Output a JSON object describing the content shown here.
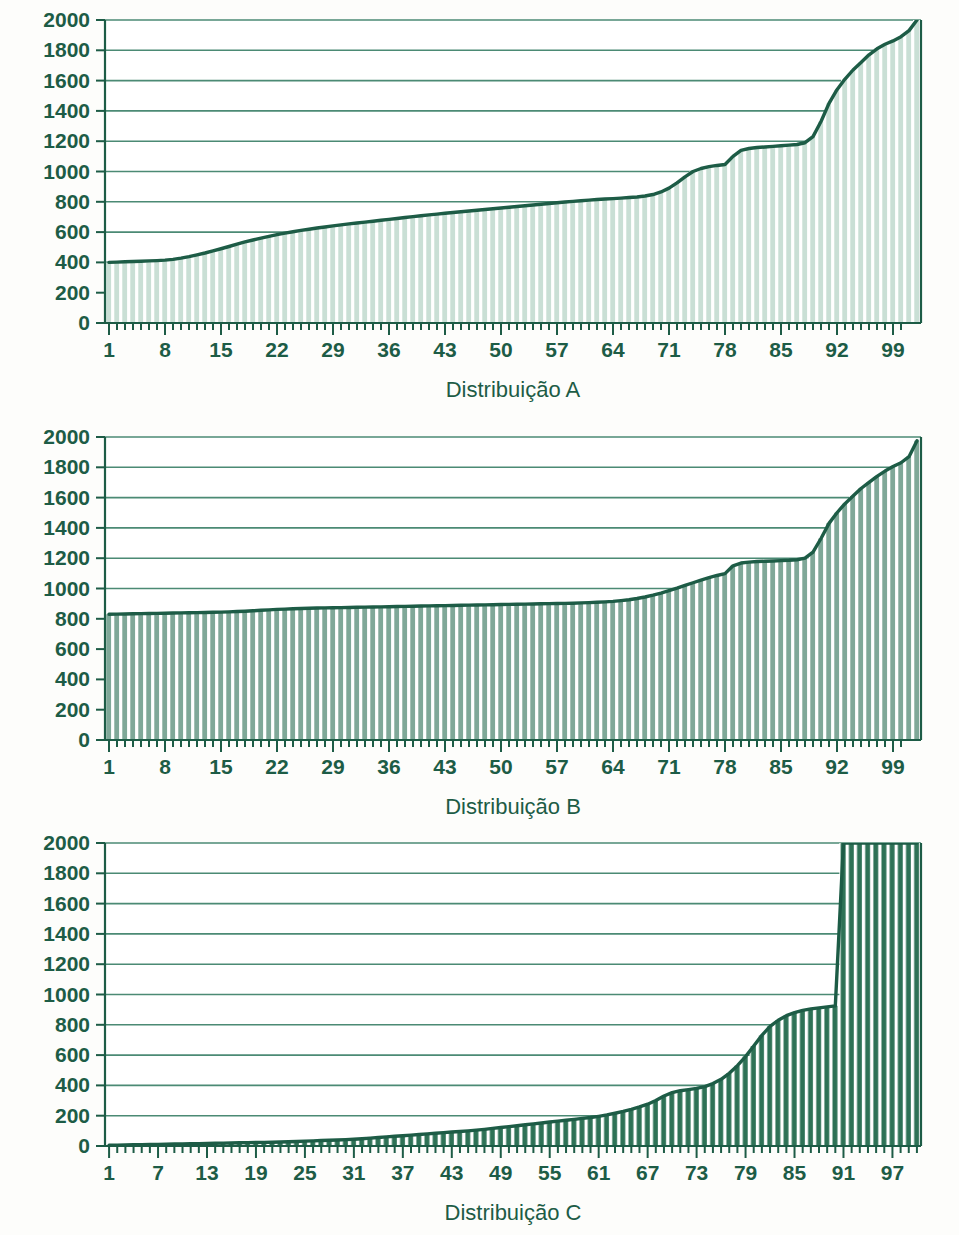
{
  "figure": {
    "background_color": "#fdfdfb",
    "axis_color": "#1d5c46",
    "gridline_color": "#4b8a74"
  },
  "chart_data": [
    {
      "type": "area",
      "id": "distribuicao-a",
      "title": "",
      "xlabel": "Distribuição A",
      "ylabel": "",
      "xlim": [
        1,
        100
      ],
      "ylim": [
        0,
        2000
      ],
      "grid": true,
      "legend": "none",
      "bar_fill_color": "#c9dfd5",
      "bar_gap_color": "#ffffff",
      "line_color": "#1d5c46",
      "ytick_labels": [
        "2000",
        "1800",
        "1600",
        "1400",
        "1200",
        "1000",
        "800",
        "600",
        "400",
        "200",
        "0"
      ],
      "ytick_values": [
        2000,
        1800,
        1600,
        1400,
        1200,
        1000,
        800,
        600,
        400,
        200,
        0
      ],
      "xtick_labels": [
        "1",
        "8",
        "15",
        "22",
        "29",
        "36",
        "43",
        "50",
        "57",
        "64",
        "71",
        "78",
        "85",
        "92",
        "99"
      ],
      "xtick_values": [
        1,
        8,
        15,
        22,
        29,
        36,
        43,
        50,
        57,
        64,
        71,
        78,
        85,
        92,
        99
      ],
      "x": [
        1,
        2,
        3,
        4,
        5,
        6,
        7,
        8,
        9,
        10,
        11,
        12,
        13,
        14,
        15,
        16,
        17,
        18,
        19,
        20,
        21,
        22,
        23,
        24,
        25,
        26,
        27,
        28,
        29,
        30,
        31,
        32,
        33,
        34,
        35,
        36,
        37,
        38,
        39,
        40,
        41,
        42,
        43,
        44,
        45,
        46,
        47,
        48,
        49,
        50,
        51,
        52,
        53,
        54,
        55,
        56,
        57,
        58,
        59,
        60,
        61,
        62,
        63,
        64,
        65,
        66,
        67,
        68,
        69,
        70,
        71,
        72,
        73,
        74,
        75,
        76,
        77,
        78,
        79,
        80,
        81,
        82,
        83,
        84,
        85,
        86,
        87,
        88,
        89,
        90,
        91,
        92,
        93,
        94,
        95,
        96,
        97,
        98,
        99,
        100
      ],
      "values": [
        400,
        402,
        404,
        406,
        408,
        410,
        412,
        415,
        420,
        428,
        438,
        450,
        462,
        476,
        490,
        505,
        520,
        535,
        548,
        560,
        572,
        583,
        593,
        602,
        611,
        619,
        627,
        634,
        641,
        648,
        654,
        660,
        666,
        672,
        678,
        684,
        690,
        696,
        702,
        708,
        714,
        719,
        724,
        729,
        734,
        739,
        744,
        749,
        754,
        759,
        764,
        769,
        774,
        779,
        784,
        789,
        794,
        799,
        803,
        807,
        811,
        815,
        818,
        821,
        824,
        828,
        832,
        838,
        848,
        865,
        890,
        925,
        965,
        1000,
        1020,
        1032,
        1040,
        1046,
        1100,
        1140,
        1152,
        1158,
        1162,
        1166,
        1170,
        1174,
        1178,
        1190,
        1230,
        1330,
        1450,
        1540,
        1610,
        1670,
        1720,
        1770,
        1810,
        1840,
        1862,
        1890,
        1930,
        2000
      ]
    },
    {
      "type": "area",
      "id": "distribuicao-b",
      "title": "",
      "xlabel": "Distribuição B",
      "ylabel": "",
      "xlim": [
        1,
        100
      ],
      "ylim": [
        0,
        2000
      ],
      "grid": true,
      "legend": "none",
      "bar_fill_color": "#7fa898",
      "bar_gap_color": "#ffffff",
      "line_color": "#1d5c46",
      "ytick_labels": [
        "2000",
        "1800",
        "1600",
        "1400",
        "1200",
        "1000",
        "800",
        "600",
        "400",
        "200",
        "0"
      ],
      "ytick_values": [
        2000,
        1800,
        1600,
        1400,
        1200,
        1000,
        800,
        600,
        400,
        200,
        0
      ],
      "xtick_labels": [
        "1",
        "8",
        "15",
        "22",
        "29",
        "36",
        "43",
        "50",
        "57",
        "64",
        "71",
        "78",
        "85",
        "92",
        "99"
      ],
      "xtick_values": [
        1,
        8,
        15,
        22,
        29,
        36,
        43,
        50,
        57,
        64,
        71,
        78,
        85,
        92,
        99
      ],
      "x": [
        1,
        2,
        3,
        4,
        5,
        6,
        7,
        8,
        9,
        10,
        11,
        12,
        13,
        14,
        15,
        16,
        17,
        18,
        19,
        20,
        21,
        22,
        23,
        24,
        25,
        26,
        27,
        28,
        29,
        30,
        31,
        32,
        33,
        34,
        35,
        36,
        37,
        38,
        39,
        40,
        41,
        42,
        43,
        44,
        45,
        46,
        47,
        48,
        49,
        50,
        51,
        52,
        53,
        54,
        55,
        56,
        57,
        58,
        59,
        60,
        61,
        62,
        63,
        64,
        65,
        66,
        67,
        68,
        69,
        70,
        71,
        72,
        73,
        74,
        75,
        76,
        77,
        78,
        79,
        80,
        81,
        82,
        83,
        84,
        85,
        86,
        87,
        88,
        89,
        90,
        91,
        92,
        93,
        94,
        95,
        96,
        97,
        98,
        99,
        100
      ],
      "values": [
        830,
        831,
        832,
        833,
        834,
        835,
        836,
        837,
        838,
        839,
        840,
        841,
        842,
        843,
        844,
        846,
        848,
        850,
        853,
        856,
        859,
        862,
        864,
        866,
        868,
        870,
        871,
        872,
        873,
        874,
        875,
        876,
        877,
        878,
        879,
        880,
        881,
        882,
        883,
        884,
        885,
        886,
        887,
        888,
        889,
        890,
        891,
        892,
        893,
        894,
        895,
        896,
        897,
        898,
        899,
        900,
        901,
        902,
        903,
        905,
        907,
        909,
        912,
        915,
        920,
        926,
        934,
        944,
        956,
        970,
        986,
        1002,
        1020,
        1038,
        1056,
        1072,
        1086,
        1098,
        1150,
        1168,
        1174,
        1178,
        1180,
        1182,
        1184,
        1186,
        1190,
        1200,
        1240,
        1330,
        1430,
        1500,
        1560,
        1610,
        1660,
        1700,
        1740,
        1775,
        1805,
        1830,
        1870,
        1975
      ]
    },
    {
      "type": "area",
      "id": "distribuicao-c",
      "title": "",
      "xlabel": "Distribuição C",
      "ylabel": "",
      "xlim": [
        1,
        100
      ],
      "ylim": [
        0,
        2000
      ],
      "grid": true,
      "legend": "none",
      "bar_fill_color": "#2e7256",
      "bar_gap_color": "#ffffff",
      "line_color": "#1d5c46",
      "ytick_labels": [
        "2000",
        "1800",
        "1600",
        "1400",
        "1200",
        "1000",
        "800",
        "600",
        "400",
        "200",
        "0"
      ],
      "ytick_values": [
        2000,
        1800,
        1600,
        1400,
        1200,
        1000,
        800,
        600,
        400,
        200,
        0
      ],
      "xtick_labels": [
        "1",
        "7",
        "13",
        "19",
        "25",
        "31",
        "37",
        "43",
        "49",
        "55",
        "61",
        "67",
        "73",
        "79",
        "85",
        "91",
        "97"
      ],
      "xtick_values": [
        1,
        7,
        13,
        19,
        25,
        31,
        37,
        43,
        49,
        55,
        61,
        67,
        73,
        79,
        85,
        91,
        97
      ],
      "x": [
        1,
        2,
        3,
        4,
        5,
        6,
        7,
        8,
        9,
        10,
        11,
        12,
        13,
        14,
        15,
        16,
        17,
        18,
        19,
        20,
        21,
        22,
        23,
        24,
        25,
        26,
        27,
        28,
        29,
        30,
        31,
        32,
        33,
        34,
        35,
        36,
        37,
        38,
        39,
        40,
        41,
        42,
        43,
        44,
        45,
        46,
        47,
        48,
        49,
        50,
        51,
        52,
        53,
        54,
        55,
        56,
        57,
        58,
        59,
        60,
        61,
        62,
        63,
        64,
        65,
        66,
        67,
        68,
        69,
        70,
        71,
        72,
        73,
        74,
        75,
        76,
        77,
        78,
        79,
        80,
        81,
        82,
        83,
        84,
        85,
        86,
        87,
        88,
        89,
        90,
        91,
        92,
        93,
        94,
        95,
        96,
        97,
        98,
        99,
        100
      ],
      "values": [
        5,
        6,
        7,
        8,
        9,
        10,
        11,
        12,
        13,
        14,
        15,
        16,
        17,
        18,
        19,
        20,
        21,
        22,
        23,
        24,
        25,
        26,
        28,
        30,
        32,
        34,
        36,
        38,
        40,
        42,
        45,
        48,
        52,
        56,
        60,
        64,
        68,
        72,
        76,
        80,
        84,
        88,
        92,
        96,
        100,
        105,
        110,
        116,
        122,
        128,
        134,
        140,
        146,
        152,
        158,
        164,
        170,
        176,
        182,
        188,
        196,
        205,
        216,
        228,
        242,
        258,
        276,
        300,
        330,
        352,
        365,
        372,
        380,
        392,
        412,
        440,
        480,
        530,
        590,
        660,
        730,
        790,
        830,
        860,
        880,
        895,
        905,
        912,
        918,
        925,
        2000,
        2000,
        2000,
        2000,
        2000,
        2000,
        2000,
        2000,
        2000,
        2000
      ]
    }
  ]
}
